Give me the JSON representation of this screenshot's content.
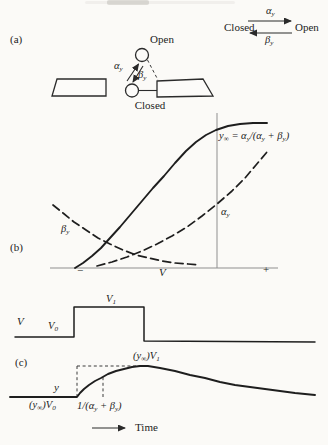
{
  "panel_a": {
    "label": "(a)",
    "open_label": "Open",
    "closed_label": "Closed",
    "alpha": [
      {
        "t": "α"
      },
      {
        "s": "y"
      }
    ],
    "beta": [
      {
        "t": "β"
      },
      {
        "s": "y"
      }
    ]
  },
  "scheme": {
    "closed_label": "Closed",
    "open_label": "Open",
    "alpha": [
      {
        "t": "α"
      },
      {
        "s": "y"
      }
    ],
    "beta": [
      {
        "t": "β"
      },
      {
        "s": "y"
      }
    ]
  },
  "panel_b": {
    "label": "(b)",
    "y_inf_equation": [
      {
        "t": "y"
      },
      {
        "s": "∞"
      },
      {
        "t": " = α"
      },
      {
        "s": "y"
      },
      {
        "t": "/(α"
      },
      {
        "s": "y"
      },
      {
        "t": " + β"
      },
      {
        "s": "y"
      },
      {
        "t": ")"
      }
    ],
    "alpha": [
      {
        "t": "α"
      },
      {
        "s": "y"
      }
    ],
    "beta": [
      {
        "t": "β"
      },
      {
        "s": "y"
      }
    ],
    "axis_minus": "−",
    "axis_v": "V",
    "axis_plus": "+"
  },
  "pulse": {
    "v_label": "V",
    "v0": [
      {
        "t": "V"
      },
      {
        "s": "0"
      }
    ],
    "v1": [
      {
        "t": "V"
      },
      {
        "s": "1"
      }
    ]
  },
  "panel_c": {
    "label": "(c)",
    "y_label": "y",
    "peak_value": [
      {
        "t": "(y"
      },
      {
        "s": "∞"
      },
      {
        "t": ")V"
      },
      {
        "s": "1"
      }
    ],
    "baseline_value": [
      {
        "t": "(y"
      },
      {
        "s": "∞"
      },
      {
        "t": ")V"
      },
      {
        "s": "0"
      }
    ],
    "time_constant": [
      {
        "t": "1/(α"
      },
      {
        "s": "y"
      },
      {
        "t": " + β"
      },
      {
        "s": "y"
      },
      {
        "t": ")"
      }
    ],
    "time_label": "Time"
  },
  "curves": {
    "y_inf": [
      [
        75,
        268
      ],
      [
        83,
        263
      ],
      [
        92,
        256
      ],
      [
        101,
        248
      ],
      [
        110,
        238
      ],
      [
        120,
        227
      ],
      [
        131,
        214
      ],
      [
        142,
        201
      ],
      [
        153,
        188
      ],
      [
        164,
        176
      ],
      [
        175,
        163
      ],
      [
        186,
        151
      ],
      [
        196,
        142
      ],
      [
        206,
        135
      ],
      [
        216,
        130
      ],
      [
        228,
        126
      ],
      [
        240,
        124
      ],
      [
        253,
        123
      ],
      [
        267,
        123
      ]
    ],
    "beta_y": [
      [
        53,
        205
      ],
      [
        63,
        213
      ],
      [
        74,
        222
      ],
      [
        86,
        230
      ],
      [
        98,
        238
      ],
      [
        110,
        244
      ],
      [
        123,
        250
      ],
      [
        136,
        255
      ],
      [
        149,
        258
      ],
      [
        162,
        261
      ],
      [
        175,
        263
      ],
      [
        188,
        264
      ],
      [
        200,
        265
      ]
    ],
    "alpha_y": [
      [
        97,
        266
      ],
      [
        112,
        262
      ],
      [
        127,
        257
      ],
      [
        142,
        251
      ],
      [
        157,
        244
      ],
      [
        172,
        236
      ],
      [
        187,
        227
      ],
      [
        202,
        216
      ],
      [
        217,
        204
      ],
      [
        232,
        191
      ],
      [
        245,
        178
      ],
      [
        256,
        165
      ],
      [
        267,
        152
      ]
    ],
    "v_pulse": [
      [
        15,
        337
      ],
      [
        74,
        337
      ],
      [
        74,
        307
      ],
      [
        144,
        307
      ],
      [
        144,
        341
      ],
      [
        315,
        342
      ]
    ],
    "y_response": [
      [
        10,
        397
      ],
      [
        77,
        397
      ],
      [
        80,
        393
      ],
      [
        84,
        389
      ],
      [
        89,
        385
      ],
      [
        95,
        381
      ],
      [
        101,
        378
      ],
      [
        108,
        374
      ],
      [
        116,
        371
      ],
      [
        124,
        369
      ],
      [
        132,
        367
      ],
      [
        140,
        366
      ],
      [
        148,
        366
      ],
      [
        160,
        368
      ],
      [
        175,
        371
      ],
      [
        190,
        375
      ],
      [
        205,
        378
      ],
      [
        220,
        382
      ],
      [
        235,
        385
      ],
      [
        250,
        387
      ],
      [
        265,
        389
      ],
      [
        280,
        391
      ],
      [
        295,
        393
      ],
      [
        315,
        395
      ]
    ]
  },
  "chart_data": [
    {
      "type": "line",
      "panel": "b",
      "title": "Voltage dependence of gating: steady-state open fraction and rate constants (qualitative sketch)",
      "xlabel": "V",
      "x_tick_labels": [
        "−",
        "V",
        "+"
      ],
      "ylabel": "",
      "grid": false,
      "series": [
        {
          "name": "y∞ = αy/(αy + βy)",
          "style": "solid",
          "points_key": "y_inf"
        },
        {
          "name": "βy",
          "style": "dashed",
          "points_key": "beta_y"
        },
        {
          "name": "αy",
          "style": "dashed",
          "points_key": "alpha_y"
        }
      ],
      "annotations": [
        "thin vertical reference line near right side at test potential"
      ]
    },
    {
      "type": "line",
      "panel": "c",
      "title": "Response of y to a voltage step from V0 to V1 (qualitative sketch)",
      "xlabel": "Time",
      "series": [
        {
          "name": "V command pulse (V0 → V1 → V0)",
          "style": "solid",
          "points_key": "v_pulse"
        },
        {
          "name": "y(t): exponential rise to (y∞)V1 then slow decay toward (y∞)V0",
          "style": "solid",
          "points_key": "y_response"
        }
      ],
      "annotations": [
        "dashed construction marking time constant 1/(αy + βy)"
      ]
    }
  ]
}
